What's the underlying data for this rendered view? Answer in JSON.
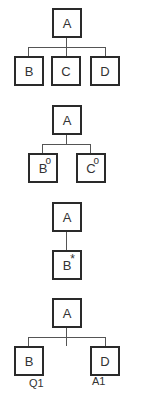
{
  "diagrams": [
    {
      "root": {
        "label": "A"
      },
      "children": [
        {
          "label": "B",
          "marker": ""
        },
        {
          "label": "C",
          "marker": ""
        },
        {
          "label": "D",
          "marker": ""
        }
      ]
    },
    {
      "root": {
        "label": "A"
      },
      "children": [
        {
          "label": "B",
          "marker": "o"
        },
        {
          "label": "C",
          "marker": "o"
        }
      ]
    },
    {
      "root": {
        "label": "A"
      },
      "children": [
        {
          "label": "B",
          "marker": "*"
        }
      ]
    },
    {
      "root": {
        "label": "A"
      },
      "children": [
        {
          "label": "B",
          "marker": "",
          "annotation": "Q1"
        },
        {
          "label": "D",
          "marker": "",
          "annotation": "A1"
        }
      ]
    }
  ],
  "colors": {
    "border": "#2a2a2a",
    "line": "#555555",
    "text": "#333333"
  }
}
